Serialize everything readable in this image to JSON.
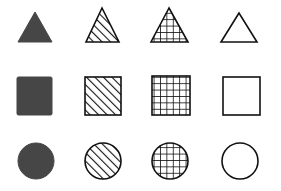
{
  "colors": {
    "solid_fill": "#464646",
    "stroke": "#111111",
    "background": "#ffffff"
  },
  "patterns": [
    "solid",
    "diagonal-hatch",
    "crosshatch-grid",
    "empty"
  ],
  "rows": [
    {
      "shape": "triangle",
      "items": [
        {
          "pattern": "solid",
          "apex": [
            35,
            12
          ],
          "base_left": [
            18,
            42
          ],
          "base_right": [
            52,
            42
          ]
        },
        {
          "pattern": "diagonal-hatch",
          "apex": [
            102,
            8
          ],
          "base_left": [
            86,
            42
          ],
          "base_right": [
            119,
            42
          ]
        },
        {
          "pattern": "crosshatch-grid",
          "apex": [
            169,
            8
          ],
          "base_left": [
            151,
            42
          ],
          "base_right": [
            188,
            42
          ]
        },
        {
          "pattern": "empty",
          "apex": [
            239,
            13
          ],
          "base_left": [
            221,
            42
          ],
          "base_right": [
            257,
            42
          ]
        }
      ]
    },
    {
      "shape": "square",
      "items": [
        {
          "pattern": "solid",
          "x": 17,
          "y": 77,
          "w": 35,
          "h": 38
        },
        {
          "pattern": "diagonal-hatch",
          "x": 85,
          "y": 77,
          "w": 36,
          "h": 38
        },
        {
          "pattern": "crosshatch-grid",
          "x": 152,
          "y": 76,
          "w": 38,
          "h": 39
        },
        {
          "pattern": "empty",
          "x": 223,
          "y": 77,
          "w": 37,
          "h": 38
        }
      ]
    },
    {
      "shape": "circle",
      "items": [
        {
          "pattern": "solid",
          "cx": 36,
          "cy": 161,
          "r": 18
        },
        {
          "pattern": "diagonal-hatch",
          "cx": 103,
          "cy": 161,
          "r": 18
        },
        {
          "pattern": "crosshatch-grid",
          "cx": 170,
          "cy": 161,
          "r": 18
        },
        {
          "pattern": "empty",
          "cx": 240,
          "cy": 161,
          "r": 18
        }
      ]
    }
  ]
}
